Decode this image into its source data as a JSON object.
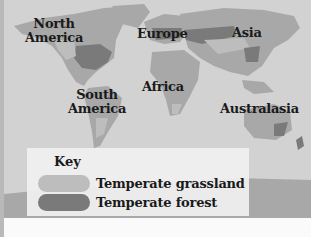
{
  "map": {
    "title": "World map of temperate biomes",
    "labels": {
      "north_america": "North America",
      "north_america_l1": "North",
      "north_america_l2": "America",
      "europe": "Europe",
      "asia": "Asia",
      "africa": "Africa",
      "south_america_l1": "South",
      "south_america_l2": "America",
      "australasia": "Australasia"
    },
    "colors": {
      "ocean": "#d2d2d2",
      "land": "#a8a8a8",
      "grassland": "#bdbdbd",
      "forest": "#7a7a7a"
    }
  },
  "key": {
    "title": "Key",
    "items": [
      {
        "label": "Temperate grassland",
        "color": "#bdbdbd"
      },
      {
        "label": "Temperate forest",
        "color": "#7a7a7a"
      }
    ]
  }
}
